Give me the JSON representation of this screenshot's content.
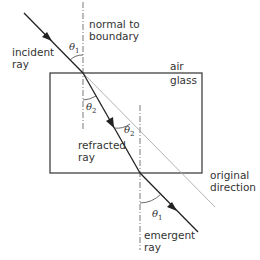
{
  "diagram": {
    "labels": {
      "normal": [
        "normal to",
        "boundary"
      ],
      "incident": [
        "incident",
        "ray"
      ],
      "air": "air",
      "glass": "glass",
      "refracted": [
        "refracted",
        "ray"
      ],
      "original": [
        "original",
        "direction"
      ],
      "emergent": [
        "emergent",
        "ray"
      ]
    },
    "angles": {
      "theta1_top": {
        "symbol": "θ",
        "sub": "1"
      },
      "theta2_inside": {
        "symbol": "θ",
        "sub": "2"
      },
      "theta2_alt": {
        "symbol": "θ",
        "sub": "2"
      },
      "theta1_bottom": {
        "symbol": "θ",
        "sub": "1"
      }
    },
    "colors": {
      "ray": "#222222",
      "block": "#333333",
      "normal": "#555555",
      "original_direction": "#aaaaaa"
    }
  }
}
